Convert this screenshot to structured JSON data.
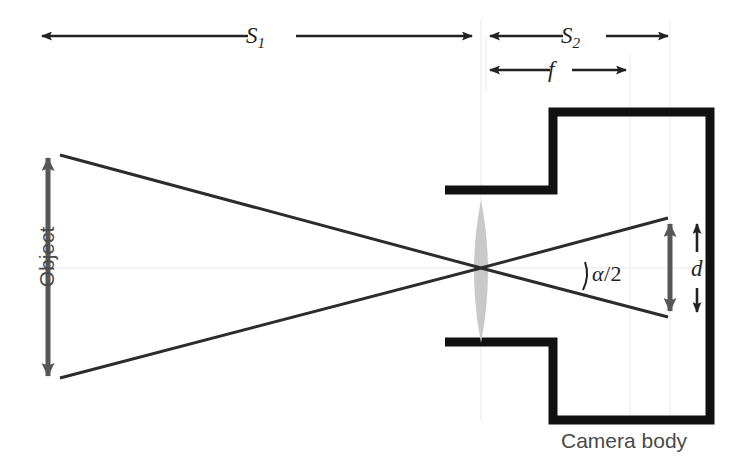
{
  "figure": {
    "type": "optics-ray-diagram",
    "background_color": "#ffffff"
  },
  "labels": {
    "s1": {
      "base": "S",
      "sub": "1",
      "text": "S_1",
      "x": 258,
      "y": 36
    },
    "s2": {
      "base": "S",
      "sub": "2",
      "text": "S_2",
      "x": 573,
      "y": 36
    },
    "f": {
      "text": "f",
      "x": 556,
      "y": 70
    },
    "d": {
      "text": "d",
      "x": 697,
      "y": 268
    },
    "alpha": {
      "text": "α/2",
      "symbol": "α",
      "slash": "/",
      "number": "2",
      "x": 610,
      "y": 276
    },
    "object": {
      "text": "Object",
      "x": 28,
      "y": 268,
      "rotation": -90,
      "color": "#4a4a4a"
    },
    "camera_body": {
      "text": "Camera body",
      "x": 630,
      "y": 440,
      "color": "#4a4a4a"
    }
  },
  "dimension_arrows": [
    {
      "name": "s1",
      "label": "S_1",
      "orientation": "horizontal",
      "x_start": 38,
      "x_end": 476,
      "y": 36,
      "heads": "both",
      "color": "#222222"
    },
    {
      "name": "s2",
      "label": "S_2",
      "orientation": "horizontal",
      "x_start": 486,
      "x_end": 672,
      "y": 36,
      "heads": "both",
      "color": "#222222"
    },
    {
      "name": "f",
      "label": "f",
      "orientation": "horizontal",
      "x_start": 486,
      "x_end": 630,
      "y": 70,
      "heads": "both",
      "color": "#222222"
    },
    {
      "name": "d",
      "label": "d",
      "orientation": "vertical",
      "x": 697,
      "y_start": 220,
      "y_end": 316,
      "heads": "both",
      "color": "#222222"
    },
    {
      "name": "object",
      "label": "Object",
      "orientation": "vertical",
      "x": 48,
      "y_start": 152,
      "y_end": 382,
      "heads": "both",
      "color": "#575757"
    },
    {
      "name": "image",
      "label": "image-height",
      "orientation": "vertical",
      "x": 670,
      "y_start": 218,
      "y_end": 317,
      "heads": "both",
      "color": "#575757"
    }
  ],
  "rays": [
    {
      "name": "upper-ray",
      "from_x": 60,
      "from_y": 155,
      "via_x": 481,
      "via_y": 268,
      "to_x": 668,
      "to_y": 218
    },
    {
      "name": "lower-ray",
      "from_x": 60,
      "from_y": 378,
      "via_x": 481,
      "via_y": 268,
      "to_x": 668,
      "to_y": 317
    }
  ],
  "lens": {
    "name": "converging-lens",
    "center_x": 481,
    "center_y": 271,
    "half_width": 14,
    "top_y": 200,
    "bottom_y": 343,
    "fill": "#c9c9c9"
  },
  "optical_axis": {
    "y": 268,
    "x_start": 38,
    "x_end": 710,
    "color": "#f2f2f2"
  },
  "camera_body": {
    "name": "camera-body-outline",
    "stroke": "#111111",
    "stroke_width": 9,
    "left_arm_x": 445,
    "step_x": 553,
    "right_x": 710,
    "top_arm_y": 190,
    "top_y": 112,
    "bottom_arm_y": 342,
    "bottom_y": 420
  },
  "guides": [
    {
      "name": "guide-lens-plane",
      "x": 481,
      "y_start": 20,
      "y_end": 420,
      "color": "#f4f4f4"
    },
    {
      "name": "guide-focal-plane",
      "x": 630,
      "y_start": 55,
      "y_end": 420,
      "color": "#f4f4f4"
    },
    {
      "name": "guide-sensor-plane",
      "x": 670,
      "y_start": 20,
      "y_end": 420,
      "color": "#f4f4f4"
    }
  ],
  "top_cropped_caption": " "
}
